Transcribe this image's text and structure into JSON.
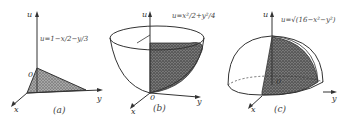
{
  "figure": {
    "panels": [
      {
        "id": "a",
        "caption": "(a)",
        "equation": "u=1−x/2−y/3",
        "axes": {
          "u": "u",
          "x": "x",
          "y": "y",
          "origin": "0"
        },
        "surface": "plane"
      },
      {
        "id": "b",
        "caption": "(b)",
        "equation": "u=x²/2+y²/4",
        "axes": {
          "u": "u",
          "x": "x",
          "y": "y",
          "origin": "0"
        },
        "surface": "paraboloid"
      },
      {
        "id": "c",
        "caption": "(c)",
        "equation": "u=√(16−x²−y²)",
        "axes": {
          "u": "u",
          "x": "x",
          "y": "y",
          "origin": "0"
        },
        "surface": "hemisphere"
      }
    ],
    "colors": {
      "ink": "#333333",
      "shade": "#8a8a8a",
      "background": "#ffffff"
    }
  }
}
